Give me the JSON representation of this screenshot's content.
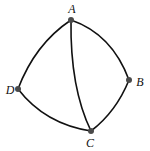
{
  "diagram": {
    "type": "graph",
    "nodes": [
      {
        "id": "A",
        "label": "A",
        "x": 71,
        "y": 20,
        "label_x": 72,
        "label_y": 9
      },
      {
        "id": "B",
        "label": "B",
        "x": 129,
        "y": 80,
        "label_x": 140,
        "label_y": 82
      },
      {
        "id": "C",
        "label": "C",
        "x": 91,
        "y": 131,
        "label_x": 90,
        "label_y": 143
      },
      {
        "id": "D",
        "label": "D",
        "x": 18,
        "y": 89,
        "label_x": 10,
        "label_y": 90
      }
    ],
    "edges": [
      {
        "from": "A",
        "to": "B",
        "curved": true
      },
      {
        "from": "B",
        "to": "C",
        "curved": true
      },
      {
        "from": "C",
        "to": "D",
        "curved": true
      },
      {
        "from": "D",
        "to": "A",
        "curved": true
      },
      {
        "from": "A",
        "to": "C",
        "curved": true
      }
    ],
    "colors": {
      "edge": "#111111",
      "node": "#4a4a4a",
      "label": "#111111",
      "background": "#ffffff"
    }
  }
}
